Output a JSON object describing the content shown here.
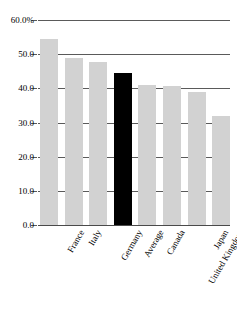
{
  "chart_data": {
    "type": "bar",
    "title": "",
    "subtitle": "",
    "xlabel": "",
    "ylabel": "",
    "categories": [
      "France",
      "Italy",
      "Germany",
      "Average",
      "Canada",
      "United Kingdom",
      "Japan",
      "United States"
    ],
    "values": [
      54.5,
      49.0,
      47.6,
      44.5,
      41.0,
      40.6,
      38.9,
      31.9
    ],
    "ylim": [
      0.0,
      60.0
    ],
    "ytick_values": [
      60.0,
      50.0,
      40.0,
      30.0,
      20.0,
      10.0,
      0.0
    ],
    "ytick_labels": [
      "60.0%",
      "50.0",
      "40.0",
      "30.0",
      "20.0",
      "10.0",
      "0.0"
    ],
    "grid": true,
    "legend": "none",
    "highlight_category": "Average",
    "bar_color": "#d2d2d2",
    "highlight_color": "#000000",
    "gridline_color": "#5a5a5a",
    "axis_text_color": "#000000"
  }
}
